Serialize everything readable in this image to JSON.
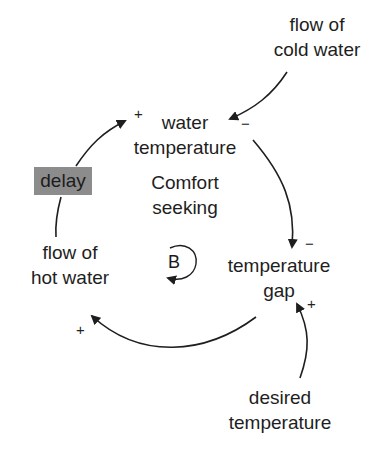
{
  "diagram": {
    "type": "causal loop diagram",
    "nodes": {
      "flow_cold_water": "flow of\ncold water",
      "flow_cold_water_l1": "flow of",
      "flow_cold_water_l2": "cold water",
      "water_temperature_l1": "water",
      "water_temperature_l2": "temperature",
      "temperature_gap_l1": "temperature",
      "temperature_gap_l2": "gap",
      "desired_temperature_l1": "desired",
      "desired_temperature_l2": "temperature",
      "flow_hot_water_l1": "flow of",
      "flow_hot_water_l2": "hot water"
    },
    "delay_label": "delay",
    "loop": {
      "name_l1": "Comfort",
      "name_l2": "seeking",
      "type": "B"
    },
    "polarities": {
      "cold_to_water_temp": "−",
      "water_temp_to_gap": "−",
      "desired_to_gap": "+",
      "gap_to_hot_flow": "+",
      "hot_flow_to_water_temp": "+"
    },
    "links": [
      {
        "from": "flow of cold water",
        "to": "water temperature",
        "polarity": "−"
      },
      {
        "from": "water temperature",
        "to": "temperature gap",
        "polarity": "−"
      },
      {
        "from": "desired temperature",
        "to": "temperature gap",
        "polarity": "+"
      },
      {
        "from": "temperature gap",
        "to": "flow of hot water",
        "polarity": "+"
      },
      {
        "from": "flow of hot water",
        "to": "water temperature",
        "polarity": "+",
        "delay": true
      }
    ],
    "colors": {
      "ink": "#1e1e1e",
      "delay_box": "#8c8c8c",
      "background": "#ffffff"
    }
  }
}
